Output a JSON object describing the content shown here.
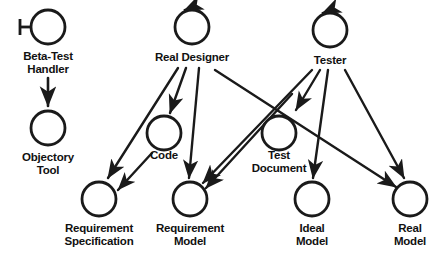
{
  "diagram": {
    "type": "actor-object-interaction-diagram",
    "stroke_color": "#1a1a1a",
    "background_color": "#ffffff",
    "nodes": [
      {
        "id": "beta-test-handler",
        "label": "Beta-Test\nHandler",
        "shape": "actor-circle-with-stem",
        "cx": 48,
        "cy": 27,
        "r": 17
      },
      {
        "id": "objectory-tool",
        "label": "Objectory\nTool",
        "shape": "circle",
        "cx": 48,
        "cy": 128,
        "r": 17
      },
      {
        "id": "real-designer",
        "label": "Real Designer",
        "shape": "circle-with-self-loop",
        "cx": 192,
        "cy": 27,
        "r": 17
      },
      {
        "id": "tester",
        "label": "Tester",
        "shape": "circle-with-self-loop",
        "cx": 330,
        "cy": 30,
        "r": 17
      },
      {
        "id": "code",
        "label": "Code",
        "shape": "circle",
        "cx": 164,
        "cy": 133,
        "r": 17
      },
      {
        "id": "test-document",
        "label": "Test\nDocument",
        "shape": "circle",
        "cx": 279,
        "cy": 133,
        "r": 17
      },
      {
        "id": "requirement-specification",
        "label": "Requirement\nSpecification",
        "shape": "circle",
        "cx": 99,
        "cy": 199,
        "r": 17
      },
      {
        "id": "requirement-model",
        "label": "Requirement\nModel",
        "shape": "circle",
        "cx": 190,
        "cy": 199,
        "r": 17
      },
      {
        "id": "ideal-model",
        "label": "Ideal\nModel",
        "shape": "circle",
        "cx": 312,
        "cy": 199,
        "r": 17
      },
      {
        "id": "real-model",
        "label": "Real\nModel",
        "shape": "circle",
        "cx": 410,
        "cy": 199,
        "r": 17
      }
    ],
    "edges": [
      {
        "from": "beta-test-handler",
        "to": "objectory-tool",
        "style": "arrow"
      },
      {
        "from": "real-designer",
        "to": "requirement-specification",
        "style": "arrow"
      },
      {
        "from": "real-designer",
        "to": "code",
        "style": "arrow"
      },
      {
        "from": "real-designer",
        "to": "requirement-model",
        "style": "arrow"
      },
      {
        "from": "real-designer",
        "to": "real-model",
        "style": "arrow"
      },
      {
        "from": "tester",
        "to": "requirement-specification",
        "style": "arrow"
      },
      {
        "from": "tester",
        "to": "test-document",
        "style": "arrow"
      },
      {
        "from": "tester",
        "to": "ideal-model",
        "style": "arrow"
      },
      {
        "from": "tester",
        "to": "real-model",
        "style": "arrow"
      },
      {
        "from": "code",
        "to": "requirement-specification",
        "style": "arrow"
      },
      {
        "from": "test-document",
        "to": "requirement-model",
        "style": "arrow"
      }
    ]
  },
  "labels": {
    "beta_test_handler": "Beta-Test\nHandler",
    "objectory_tool": "Objectory\nTool",
    "real_designer": "Real Designer",
    "tester": "Tester",
    "code": "Code",
    "test_document": "Test\nDocument",
    "requirement_specification": "Requirement\nSpecification",
    "requirement_model": "Requirement\nModel",
    "ideal_model": "Ideal\nModel",
    "real_model": "Real\nModel"
  }
}
